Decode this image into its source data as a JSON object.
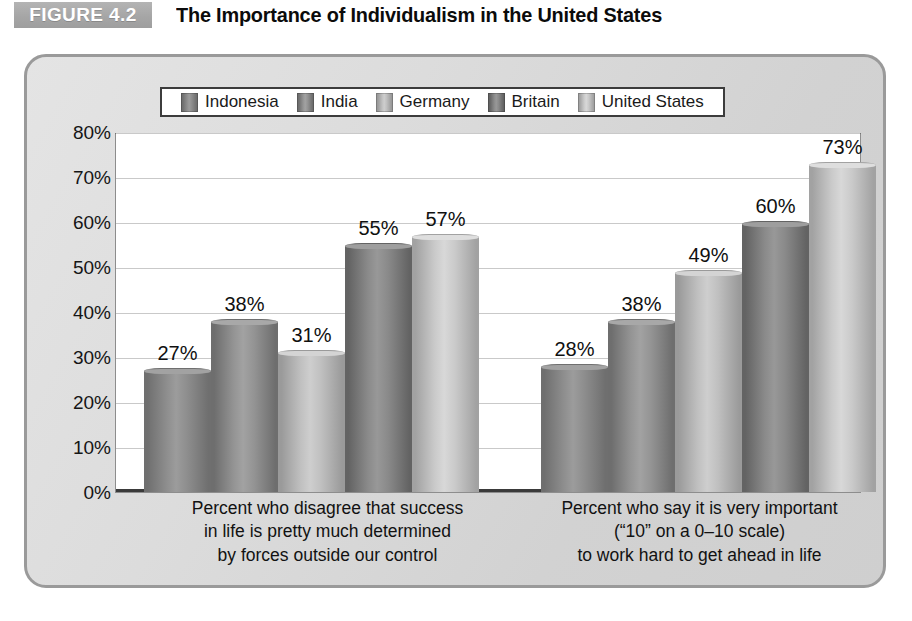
{
  "header": {
    "badge": "FIGURE 4.2",
    "title": "The Importance of Individualism in the United States"
  },
  "chart_data": {
    "type": "bar",
    "title": "The Importance of Individualism in the United States",
    "xlabel": "",
    "ylabel": "",
    "ylim": [
      0,
      80
    ],
    "ytick_labels": [
      "0%",
      "10%",
      "20%",
      "30%",
      "40%",
      "50%",
      "60%",
      "70%",
      "80%"
    ],
    "ytick_values": [
      0,
      10,
      20,
      30,
      40,
      50,
      60,
      70,
      80
    ],
    "grid": true,
    "legend_position": "top-center",
    "value_suffix": "%",
    "categories": [
      "Percent who disagree that success in life is pretty much determined by forces outside our control",
      "Percent who say it is very important (“10” on a 0–10 scale) to work hard to get ahead in life"
    ],
    "category_lines": [
      [
        "Percent who disagree that success",
        "in life is pretty much determined",
        "by forces outside our control"
      ],
      [
        "Percent who say it is very important",
        "(“10” on a 0–10 scale)",
        "to work hard to get ahead in life"
      ]
    ],
    "series": [
      {
        "name": "Indonesia",
        "color": "#8e8e8e",
        "edge": "#6f6f6f",
        "values": [
          27,
          28
        ],
        "labels": [
          "27%",
          "28%"
        ]
      },
      {
        "name": "India",
        "color": "#949494",
        "edge": "#6e6e6e",
        "values": [
          38,
          38
        ],
        "labels": [
          "38%",
          "38%"
        ]
      },
      {
        "name": "Germany",
        "color": "#c0c0c0",
        "edge": "#9a9a9a",
        "values": [
          31,
          49
        ],
        "labels": [
          "31%",
          "49%"
        ]
      },
      {
        "name": "Britain",
        "color": "#8a8a8a",
        "edge": "#636363",
        "values": [
          55,
          60
        ],
        "labels": [
          "55%",
          "60%"
        ]
      },
      {
        "name": "United States",
        "color": "#cacaca",
        "edge": "#a2a2a2",
        "values": [
          57,
          73
        ],
        "labels": [
          "57%",
          "73%"
        ]
      }
    ]
  }
}
